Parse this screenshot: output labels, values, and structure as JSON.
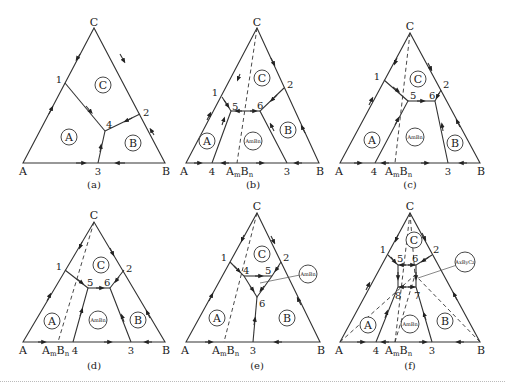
{
  "figure": {
    "panels": [
      {
        "id": "a",
        "caption": "(a)",
        "vertices": {
          "A": "A",
          "B": "B",
          "C": "C"
        },
        "points": [
          "1",
          "2",
          "3",
          "4"
        ],
        "fields": [
          "A",
          "B",
          "C"
        ]
      },
      {
        "id": "b",
        "caption": "(b)",
        "vertices": {
          "A": "A",
          "B": "B",
          "C": "C"
        },
        "compound": "AmBn",
        "points": [
          "1",
          "2",
          "3",
          "4",
          "5",
          "6"
        ],
        "fields": [
          "A",
          "B",
          "C",
          "AmBn"
        ]
      },
      {
        "id": "c",
        "caption": "(c)",
        "vertices": {
          "A": "A",
          "B": "B",
          "C": "C"
        },
        "compound": "AmBn",
        "points": [
          "1",
          "2",
          "3",
          "4",
          "5",
          "6"
        ],
        "fields": [
          "A",
          "B",
          "C",
          "AmBn"
        ]
      },
      {
        "id": "d",
        "caption": "(d)",
        "vertices": {
          "A": "A",
          "B": "B",
          "C": "C"
        },
        "compound": "AmBn",
        "points": [
          "1",
          "2",
          "3",
          "4",
          "5",
          "6"
        ],
        "fields": [
          "A",
          "B",
          "C",
          "AmBn"
        ]
      },
      {
        "id": "e",
        "caption": "(e)",
        "vertices": {
          "A": "A",
          "B": "B",
          "C": "C"
        },
        "compound": "AmBn",
        "points": [
          "1",
          "2",
          "3",
          "4",
          "5",
          "6"
        ],
        "fields": [
          "A",
          "B",
          "C",
          "AmBn"
        ],
        "callout": "AmBn"
      },
      {
        "id": "f",
        "caption": "(f)",
        "vertices": {
          "A": "A",
          "B": "B",
          "C": "C"
        },
        "compound": "AmBn",
        "points": [
          "1",
          "2",
          "3",
          "4",
          "5",
          "6",
          "7",
          "8"
        ],
        "fields": [
          "A",
          "B",
          "C",
          "AmBn"
        ],
        "callout": "AxByCz"
      }
    ],
    "labels": {
      "A": "A",
      "B": "B",
      "C": "C",
      "field_A": "A",
      "field_B": "B",
      "field_C": "C",
      "compound_base_A": "A",
      "compound_sub_m": "m",
      "compound_base_B": "B",
      "compound_sub_n": "n",
      "small_compound": "AmBn",
      "small_ternary": "AxByCz",
      "p1": "1",
      "p2": "2",
      "p3": "3",
      "p4": "4",
      "p5": "5",
      "p6": "6",
      "p7": "7",
      "p8": "8",
      "cap_a": "(a)",
      "cap_b": "(b)",
      "cap_c": "(c)",
      "cap_d": "(d)",
      "cap_e": "(e)",
      "cap_f": "(f)"
    }
  }
}
